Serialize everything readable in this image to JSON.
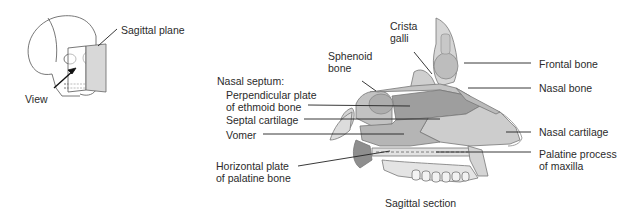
{
  "inset": {
    "sagittal_plane_label": "Sagittal plane",
    "view_label": "View"
  },
  "main": {
    "crista_galli": [
      "Crista",
      "galli"
    ],
    "sphenoid_bone": [
      "Sphenoid",
      "bone"
    ],
    "nasal_septum_heading": "Nasal septum:",
    "perpendicular_plate": [
      "Perpendicular plate",
      "of ethmoid bone"
    ],
    "septal_cartilage": "Septal cartilage",
    "vomer": "Vomer",
    "horizontal_plate": [
      "Horizontal plate",
      "of palatine bone"
    ],
    "frontal_bone": "Frontal bone",
    "nasal_bone": "Nasal bone",
    "nasal_cartilage": "Nasal cartilage",
    "palatine_process": [
      "Palatine process",
      "of maxilla"
    ],
    "caption": "Sagittal section"
  },
  "colors": {
    "bone_light": "#d9d9d9",
    "bone_mid": "#b8b8b8",
    "septum_dark": "#9a9a9a",
    "cartilage": "#cfcfcf",
    "line": "#2a2a2a"
  }
}
